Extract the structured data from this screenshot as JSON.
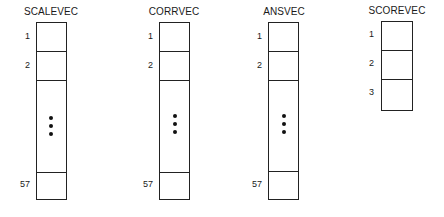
{
  "diagram": {
    "vectors": [
      {
        "name": "SCALEVEC",
        "indices": [
          "1",
          "2",
          "57"
        ],
        "ellipsis": true
      },
      {
        "name": "CORRVEC",
        "indices": [
          "1",
          "2",
          "57"
        ],
        "ellipsis": true
      },
      {
        "name": "ANSVEC",
        "indices": [
          "1",
          "2",
          "57"
        ],
        "ellipsis": true
      },
      {
        "name": "SCOREVEC",
        "indices": [
          "1",
          "2",
          "3"
        ],
        "ellipsis": false
      }
    ]
  }
}
